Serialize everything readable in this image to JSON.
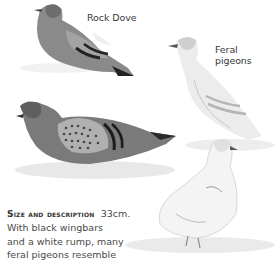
{
  "labels": {
    "rock_dove": "Rock Dove",
    "feral_pigeons": "Feral pigeons"
  },
  "description": {
    "heading": "Size and description",
    "size": "33cm.",
    "lines": [
      "With black wingbars",
      "and a white rump, many",
      "feral pigeons resemble"
    ]
  },
  "illustration": {
    "subjects": [
      "rock-dove",
      "feral-pigeon-pale",
      "feral-pigeon-chequered",
      "feral-pigeon-white"
    ]
  }
}
